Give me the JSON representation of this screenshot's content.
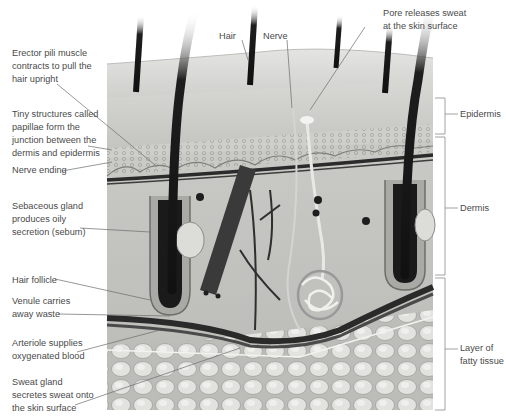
{
  "diagram": {
    "labels_left": [
      {
        "id": "erector-pili",
        "text": "Erector pili muscle\ncontracts to pull the\nhair upright"
      },
      {
        "id": "papillae",
        "text": "Tiny structures called\npapillae form the\njunction between the\ndermis and epidermis"
      },
      {
        "id": "nerve-ending",
        "text": "Nerve ending"
      },
      {
        "id": "sebaceous-gland",
        "text": "Sebaceous gland\nproduces oily\nsecretion (sebum)"
      },
      {
        "id": "hair-follicle",
        "text": "Hair follicle"
      },
      {
        "id": "venule",
        "text": "Venule carries\naway waste"
      },
      {
        "id": "arteriole",
        "text": "Arteriole supplies\noxygenated blood"
      },
      {
        "id": "sweat-gland",
        "text": "Sweat gland\nsecretes sweat onto\nthe skin surface"
      }
    ],
    "labels_top": [
      {
        "id": "hair",
        "text": "Hair"
      },
      {
        "id": "nerve",
        "text": "Nerve"
      },
      {
        "id": "pore",
        "text": "Pore releases sweat\nat the skin surface"
      }
    ],
    "labels_right": [
      {
        "id": "epidermis",
        "text": "Epidermis"
      },
      {
        "id": "dermis",
        "text": "Dermis"
      },
      {
        "id": "fatty-tissue",
        "text": "Layer of\nfatty tissue"
      }
    ]
  }
}
